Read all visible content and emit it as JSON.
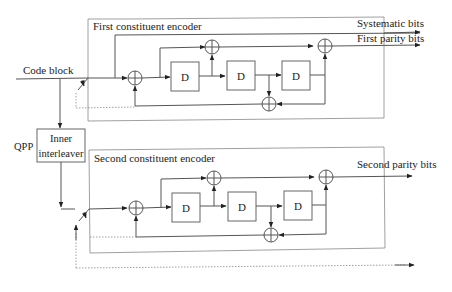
{
  "diagram": {
    "type": "LTE turbo encoder block diagram",
    "input_label": "Code block",
    "interleaver": {
      "prefix_label": "QPP",
      "line1": "Inner",
      "line2": "interleaver"
    },
    "encoder1": {
      "title": "First constituent encoder",
      "delay_labels": [
        "D",
        "D",
        "D"
      ]
    },
    "encoder2": {
      "title": "Second constituent encoder",
      "delay_labels": [
        "D",
        "D",
        "D"
      ]
    },
    "outputs": {
      "systematic": "Systematic bits",
      "first_parity": "First parity bits",
      "second_parity": "Second parity bits"
    }
  }
}
